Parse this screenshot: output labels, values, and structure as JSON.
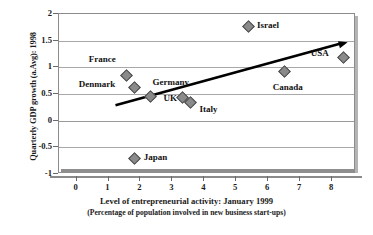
{
  "chart_data": {
    "type": "scatter",
    "title": "",
    "xlabel": "Level of entrepreneurial activity: January 1999",
    "xlabel_sub": "(Percentage of population involved in new business start-ups)",
    "ylabel": "Quarterly GDP growth (a.Avg): 1998",
    "xlim": [
      -0.55,
      8.75
    ],
    "ylim": [
      -1,
      2
    ],
    "xticks": [
      "0",
      "1",
      "2",
      "3",
      "4",
      "5",
      "6",
      "7",
      "8"
    ],
    "xtick_values": [
      0,
      1,
      2,
      3,
      4,
      5,
      6,
      7,
      8
    ],
    "yticks": [
      "2",
      "1.5",
      "1",
      "0.5",
      "0",
      "-0.5",
      "-1"
    ],
    "ytick_values": [
      2,
      1.5,
      1,
      0.5,
      0,
      -0.5,
      -1
    ],
    "grid": true,
    "legend": "none",
    "marker_color": "#8a8a8a",
    "marker_edge_color": "#4a4a4a",
    "trendline_color": "#000000",
    "points": [
      {
        "label": "France",
        "x": 1.6,
        "y": 0.82,
        "label_dx": -38,
        "label_dy": -17
      },
      {
        "label": "Denmark",
        "x": 1.85,
        "y": 0.6,
        "label_dx": -56,
        "label_dy": -4
      },
      {
        "label": "Germany",
        "x": 2.35,
        "y": 0.43,
        "label_dx": 2,
        "label_dy": -15
      },
      {
        "label": "UK",
        "x": 3.35,
        "y": 0.41,
        "label_dx": -19,
        "label_dy": 0
      },
      {
        "label": "Italy",
        "x": 3.6,
        "y": 0.32,
        "label_dx": 9,
        "label_dy": 6
      },
      {
        "label": "Israel",
        "x": 5.4,
        "y": 1.75,
        "label_dx": 9,
        "label_dy": -1
      },
      {
        "label": "Canada",
        "x": 6.55,
        "y": 0.9,
        "label_dx": -12,
        "label_dy": 15
      },
      {
        "label": "USA",
        "x": 8.4,
        "y": 1.17,
        "label_dx": -33,
        "label_dy": -4
      },
      {
        "label": "Japan",
        "x": 1.85,
        "y": -0.72,
        "label_dx": 9,
        "label_dy": -1
      }
    ],
    "trendline": {
      "x0": 1.25,
      "y0": 0.27,
      "x1": 8.52,
      "y1": 1.45,
      "arrow": true
    }
  }
}
